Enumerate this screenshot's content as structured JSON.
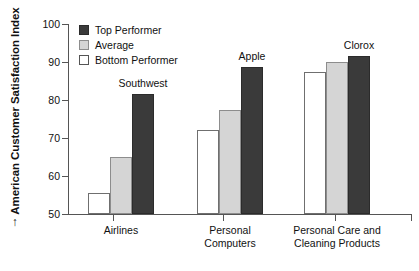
{
  "chart_data": {
    "type": "bar",
    "title": "",
    "subtitle": "",
    "xlabel": "",
    "ylabel": "American Customer Satisfaction Index",
    "ylim": [
      50,
      100
    ],
    "ytick_labels": [
      "100",
      "90",
      "80",
      "70",
      "60",
      "50"
    ],
    "ytick_values": [
      100,
      90,
      80,
      70,
      60,
      50
    ],
    "grid": false,
    "legend_position": "top-left",
    "categories": [
      "Airlines",
      "Personal Computers",
      "Personal Care and Cleaning Products"
    ],
    "category_label_lines": [
      [
        "Airlines"
      ],
      [
        "Personal",
        "Computers"
      ],
      [
        "Personal Care and",
        "Cleaning Products"
      ]
    ],
    "series": [
      {
        "name": "Bottom Performer",
        "color": "#ffffff",
        "values": [
          55.5,
          72.0,
          87.5
        ]
      },
      {
        "name": "Average",
        "color": "#d5d5d5",
        "values": [
          65.0,
          77.5,
          90.0
        ]
      },
      {
        "name": "Top Performer",
        "color": "#3a3a3a",
        "values": [
          81.5,
          88.8,
          91.5
        ]
      }
    ],
    "annotations": [
      {
        "text": "Southwest",
        "category": "Airlines",
        "series": "Top Performer"
      },
      {
        "text": "Apple",
        "category": "Personal Computers",
        "series": "Top Performer"
      },
      {
        "text": "Clorox",
        "category": "Personal Care and Cleaning Products",
        "series": "Top Performer"
      }
    ]
  },
  "axis": {
    "y_title": "American Customer Satisfaction Index",
    "y_title_arrow": "↑",
    "ticks": [
      {
        "label": "100"
      },
      {
        "label": "90"
      },
      {
        "label": "80"
      },
      {
        "label": "70"
      },
      {
        "label": "60"
      },
      {
        "label": "50"
      }
    ]
  },
  "legend": {
    "items": [
      {
        "label": "Top Performer",
        "swatch": "top-performer"
      },
      {
        "label": "Average",
        "swatch": "average"
      },
      {
        "label": "Bottom Performer",
        "swatch": "bottom-performer"
      }
    ]
  },
  "categories": [
    {
      "line1": "Airlines",
      "line2": ""
    },
    {
      "line1": "Personal",
      "line2": "Computers"
    },
    {
      "line1": "Personal Care and",
      "line2": "Cleaning Products"
    }
  ],
  "annotations": [
    {
      "label": "Southwest"
    },
    {
      "label": "Apple"
    },
    {
      "label": "Clorox"
    }
  ]
}
